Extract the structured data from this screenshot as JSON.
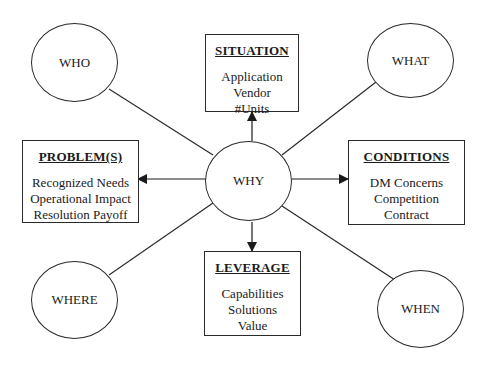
{
  "diagram": {
    "center": {
      "label": "WHY"
    },
    "corners": {
      "top_left": {
        "label": "WHO"
      },
      "top_right": {
        "label": "WHAT"
      },
      "bottom_left": {
        "label": "WHERE"
      },
      "bottom_right": {
        "label": "WHEN"
      }
    },
    "boxes": {
      "top": {
        "title": "SITUATION",
        "items": [
          "Application",
          "Vendor",
          "#Units"
        ]
      },
      "left": {
        "title": "PROBLEM(S)",
        "items": [
          "Recognized Needs",
          "Operational Impact",
          "Resolution Payoff"
        ]
      },
      "right": {
        "title": "CONDITIONS",
        "items": [
          "DM Concerns",
          "Competition",
          "Contract"
        ]
      },
      "bottom": {
        "title": "LEVERAGE",
        "items": [
          "Capabilities",
          "Solutions",
          "Value"
        ]
      }
    },
    "colors": {
      "stroke": "#2a2a2a",
      "background": "#ffffff"
    }
  }
}
